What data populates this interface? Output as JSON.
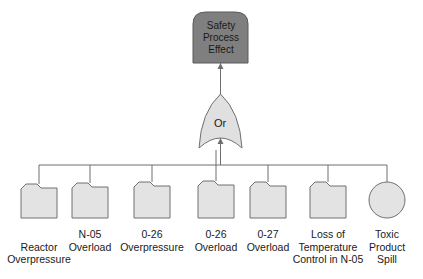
{
  "top_event": {
    "line1": "Safety",
    "line2": "Process",
    "line3": "Effect",
    "fill": "#7f7f7f"
  },
  "gate": {
    "label": "Or",
    "type": "OR",
    "fill": "#e0e0e0"
  },
  "colors": {
    "node_fill": "#e3e3e3",
    "stroke": "#707070",
    "line": "#6e6e6e"
  },
  "events": [
    {
      "shape": "folder",
      "line1": "",
      "line2": "Reactor",
      "line3": "Overpressure"
    },
    {
      "shape": "folder",
      "line1": "",
      "line2": "N-05",
      "line3": "Overload"
    },
    {
      "shape": "folder",
      "line1": "",
      "line2": "0-26",
      "line3": "Overpressure"
    },
    {
      "shape": "folder",
      "line1": "",
      "line2": "0-26",
      "line3": "Overload"
    },
    {
      "shape": "folder",
      "line1": "",
      "line2": "0-27",
      "line3": "Overload"
    },
    {
      "shape": "folder",
      "line1": "Loss of",
      "line2": "Temperature",
      "line3": "Control in N-05"
    },
    {
      "shape": "circle",
      "line1": "Toxic",
      "line2": "Product",
      "line3": "Spill"
    }
  ]
}
